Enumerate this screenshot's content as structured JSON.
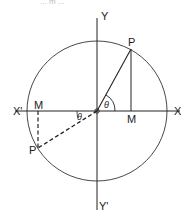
{
  "diagram": {
    "top_fragment_text": "... m ...",
    "labels": {
      "y_axis_pos": "Y",
      "y_axis_neg": "Y'",
      "x_axis_pos": "X",
      "x_axis_neg": "X'",
      "point_p": "P",
      "point_p_prime": "P",
      "foot_m": "M",
      "foot_m_prime": "M",
      "angle_theta": "θ",
      "angle_theta_2": "θ"
    },
    "geometry": {
      "center": [
        97,
        111
      ],
      "radius": 70,
      "p": [
        131,
        49
      ],
      "m": [
        131,
        111
      ],
      "p_prime": [
        38,
        148
      ],
      "m_prime": [
        38,
        111
      ]
    },
    "colors": {
      "stroke": "#222222",
      "background": "#ffffff"
    }
  }
}
